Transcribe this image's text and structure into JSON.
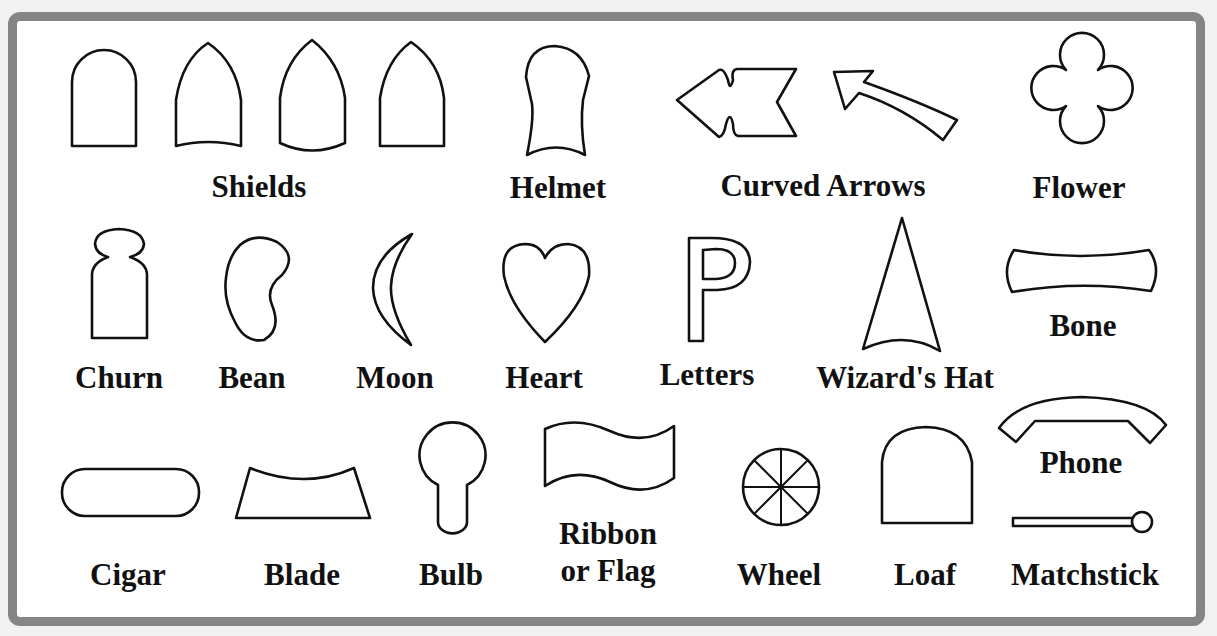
{
  "panel": {
    "border_color": "#858585",
    "background": "#ffffff",
    "stroke_color": "#111111"
  },
  "shapes": [
    {
      "id": "shields",
      "label": "Shields",
      "count": 4
    },
    {
      "id": "helmet",
      "label": "Helmet"
    },
    {
      "id": "curved-arrows",
      "label": "Curved Arrows",
      "count": 2
    },
    {
      "id": "flower",
      "label": "Flower"
    },
    {
      "id": "churn",
      "label": "Churn"
    },
    {
      "id": "bean",
      "label": "Bean"
    },
    {
      "id": "moon",
      "label": "Moon"
    },
    {
      "id": "heart",
      "label": "Heart"
    },
    {
      "id": "letters",
      "label": "Letters"
    },
    {
      "id": "wizards-hat",
      "label": "Wizard's Hat"
    },
    {
      "id": "bone",
      "label": "Bone"
    },
    {
      "id": "phone",
      "label": "Phone"
    },
    {
      "id": "cigar",
      "label": "Cigar"
    },
    {
      "id": "blade",
      "label": "Blade"
    },
    {
      "id": "bulb",
      "label": "Bulb"
    },
    {
      "id": "ribbon-or-flag",
      "label_line1": "Ribbon",
      "label_line2": "or Flag"
    },
    {
      "id": "wheel",
      "label": "Wheel"
    },
    {
      "id": "loaf",
      "label": "Loaf"
    },
    {
      "id": "matchstick",
      "label": "Matchstick"
    }
  ]
}
